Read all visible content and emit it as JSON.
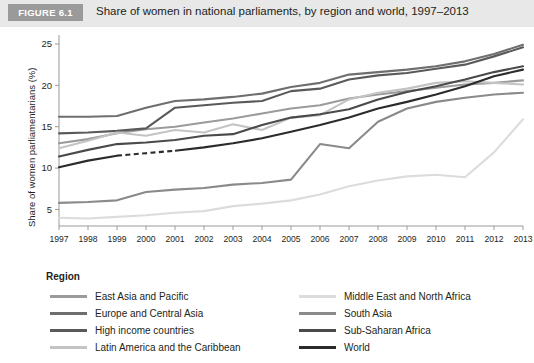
{
  "header": {
    "badge": "FIGURE 6.1",
    "title": "Share of women in national parliaments, by region and world, 1997–2013"
  },
  "legend": {
    "title": "Region",
    "left_items": [
      {
        "label": "East Asia and Pacific",
        "color": "#9b9b9b"
      },
      {
        "label": "Europe and Central Asia",
        "color": "#6e6e6e"
      },
      {
        "label": "High income countries",
        "color": "#5a5a5a"
      },
      {
        "label": "Latin America and the Caribbean",
        "color": "#c4c4c4"
      }
    ],
    "right_items": [
      {
        "label": "Middle East and North Africa",
        "color": "#dcdcdc"
      },
      {
        "label": "South Asia",
        "color": "#8a8a8a"
      },
      {
        "label": "Sub-Saharan Africa",
        "color": "#4a4a4a"
      },
      {
        "label": "World",
        "color": "#2b2b2b"
      }
    ]
  },
  "axis": {
    "ylabel": "Share of women parliamentarians (%)",
    "yticks": [
      "5",
      "10",
      "15",
      "20",
      "25"
    ],
    "xticks": [
      "1997",
      "1998",
      "1999",
      "2000",
      "2001",
      "2002",
      "2003",
      "2004",
      "2005",
      "2006",
      "2007",
      "2008",
      "2009",
      "2010",
      "2011",
      "2012",
      "2013"
    ]
  },
  "chart_data": {
    "type": "line",
    "title": "Share of women in national parliaments, by region and world, 1997–2013",
    "xlabel": "",
    "ylabel": "Share of women parliamentarians (%)",
    "xlim": [
      1997,
      2013
    ],
    "ylim": [
      3,
      25.6
    ],
    "grid": false,
    "legend_position": "bottom",
    "legend_title": "Region",
    "x": [
      1997,
      1998,
      1999,
      2000,
      2001,
      2002,
      2003,
      2004,
      2005,
      2006,
      2007,
      2008,
      2009,
      2010,
      2011,
      2012,
      2013
    ],
    "series": [
      {
        "name": "East Asia and Pacific",
        "color": "#9b9b9b",
        "values": [
          13.0,
          13.5,
          14.2,
          14.7,
          15.0,
          15.5,
          16.0,
          16.6,
          17.2,
          17.6,
          18.4,
          18.9,
          19.3,
          19.7,
          20.1,
          20.3,
          20.6
        ]
      },
      {
        "name": "Europe and Central Asia",
        "color": "#6e6e6e",
        "values": [
          16.2,
          16.2,
          16.3,
          17.3,
          18.1,
          18.3,
          18.6,
          19.0,
          19.8,
          20.3,
          21.3,
          21.6,
          21.9,
          22.3,
          22.9,
          23.8,
          24.9
        ]
      },
      {
        "name": "High income countries",
        "color": "#5a5a5a",
        "values": [
          14.2,
          14.3,
          14.5,
          14.8,
          17.3,
          17.6,
          17.9,
          18.1,
          19.3,
          19.6,
          20.7,
          21.2,
          21.5,
          22.0,
          22.5,
          23.5,
          24.6
        ]
      },
      {
        "name": "Latin America and the Caribbean",
        "color": "#c4c4c4",
        "values": [
          12.4,
          13.3,
          14.3,
          13.9,
          14.6,
          14.3,
          15.3,
          14.6,
          16.1,
          16.4,
          18.3,
          19.1,
          19.6,
          20.3,
          20.5,
          20.3,
          20.1
        ]
      },
      {
        "name": "Middle East and North Africa",
        "color": "#dcdcdc",
        "values": [
          4.0,
          3.9,
          4.1,
          4.3,
          4.6,
          4.8,
          5.4,
          5.7,
          6.1,
          6.8,
          7.8,
          8.5,
          9.0,
          9.2,
          8.9,
          11.9,
          15.9
        ]
      },
      {
        "name": "South Asia",
        "color": "#8a8a8a",
        "values": [
          5.8,
          5.9,
          6.1,
          7.1,
          7.4,
          7.6,
          8.0,
          8.2,
          8.6,
          12.9,
          12.4,
          15.6,
          17.2,
          18.0,
          18.5,
          18.9,
          19.1
        ]
      },
      {
        "name": "Sub-Saharan Africa",
        "color": "#4a4a4a",
        "values": [
          11.4,
          12.2,
          12.9,
          13.1,
          13.4,
          13.9,
          14.1,
          15.2,
          16.1,
          16.5,
          17.1,
          18.3,
          19.2,
          19.9,
          20.7,
          21.6,
          22.3
        ]
      },
      {
        "name": "World",
        "color": "#2b2b2b",
        "values": [
          10.1,
          10.9,
          11.5,
          11.8,
          12.1,
          12.5,
          13.0,
          13.6,
          14.4,
          15.2,
          16.1,
          17.2,
          18.0,
          18.9,
          19.9,
          21.1,
          21.9
        ],
        "dashed_segment": [
          1999,
          2001
        ]
      }
    ]
  }
}
